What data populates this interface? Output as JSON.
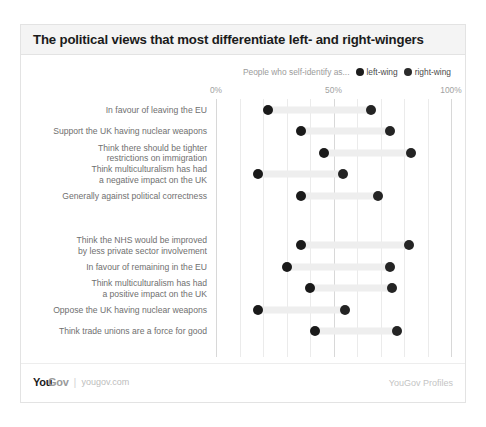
{
  "header": {
    "title": "The political views that most differentiate left- and right-wingers"
  },
  "legend": {
    "prefix": "People who self-identify as...",
    "items": [
      {
        "label": "left-wing",
        "color": "#1a1a1a",
        "icon": "filled-circle-icon"
      },
      {
        "label": "right-wing",
        "color": "#242424",
        "icon": "filled-circle-icon"
      }
    ]
  },
  "footer": {
    "brand_primary": "You",
    "brand_secondary": "Gov",
    "separator": "|",
    "url": "yougov.com",
    "right_label": "YouGov Profiles"
  },
  "chart_data": {
    "type": "bar",
    "subtype": "dumbbell",
    "title": "The political views that most differentiate left- and right-wingers",
    "xlabel": "",
    "ylabel": "",
    "xlim": [
      0,
      100
    ],
    "xticks": [
      0,
      50,
      100
    ],
    "xtick_labels": [
      "0%",
      "50%",
      "100%"
    ],
    "gridlines": [
      0,
      10,
      20,
      30,
      40,
      50,
      60,
      70,
      80,
      90,
      100
    ],
    "grid": true,
    "legend_position": "top-right",
    "series": [
      {
        "name": "left-wing",
        "color": "#1a1a1a"
      },
      {
        "name": "right-wing",
        "color": "#242424"
      }
    ],
    "groups": [
      {
        "name": "right-leaning views",
        "rows": [
          {
            "category": "In favour of leaving the EU",
            "left_wing": 22,
            "right_wing": 66
          },
          {
            "category": "Support the UK having nuclear weapons",
            "left_wing": 36,
            "right_wing": 74
          },
          {
            "category": "Think there should be tighter\nrestrictions on immigration",
            "left_wing": 46,
            "right_wing": 83
          },
          {
            "category": "Think multiculturalism has had\na negative impact on the UK",
            "left_wing": 18,
            "right_wing": 54
          },
          {
            "category": "Generally against political correctness",
            "left_wing": 36,
            "right_wing": 69
          }
        ]
      },
      {
        "name": "left-leaning views",
        "rows": [
          {
            "category": "Think the NHS would be improved\nby less private sector involvement",
            "left_wing": 36,
            "right_wing": 82
          },
          {
            "category": "In favour of remaining in the EU",
            "left_wing": 30,
            "right_wing": 74
          },
          {
            "category": "Think multiculturalism has had\na positive impact on the UK",
            "left_wing": 40,
            "right_wing": 75
          },
          {
            "category": "Oppose the UK having nuclear weapons",
            "left_wing": 18,
            "right_wing": 55
          },
          {
            "category": "Think trade unions are a force for good",
            "left_wing": 42,
            "right_wing": 77
          }
        ]
      }
    ]
  }
}
